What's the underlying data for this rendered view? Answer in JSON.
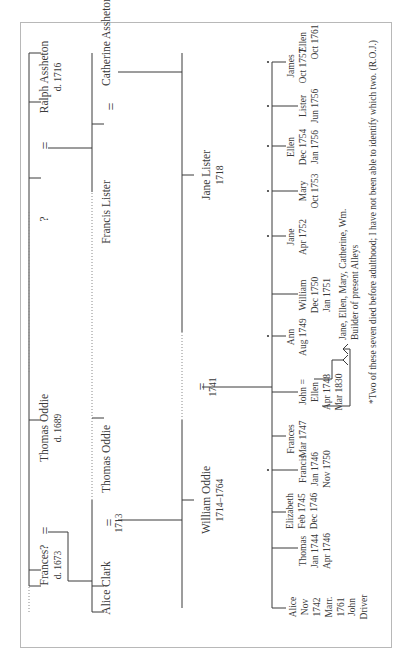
{
  "generation_1": {
    "left_couple": {
      "husband_unknown": "?",
      "wife": {
        "name": "Ralph Assheton",
        "dates": "d. 1716"
      }
    },
    "right_couple": {
      "wife": {
        "name": "Frances?",
        "dates": "d. 1673"
      },
      "husband": {
        "name": "Thomas Oddie",
        "dates": "d. 1689"
      }
    }
  },
  "generation_2": {
    "lister_side": {
      "husband": {
        "name": "Francis Lister"
      },
      "wife": {
        "name": "Catherine Assheton"
      }
    },
    "oddie_side": {
      "husband": {
        "name": "Thomas Oddie"
      },
      "wife": {
        "name": "Alice Clark"
      },
      "marriage_year": "1713"
    }
  },
  "generation_3": {
    "husband": {
      "name": "William Oddie",
      "dates": "1714–1764"
    },
    "wife": {
      "name": "Jane Lister",
      "dates": "1718"
    },
    "marriage_year": "1741"
  },
  "marriage_symbol": "=",
  "children": [
    {
      "name": "Alice",
      "lines": [
        "Nov",
        "1742",
        "Marr.",
        "1761",
        "John",
        "Driver"
      ],
      "asterisk": false
    },
    {
      "name": "Thomas",
      "lines": [
        "Jan 1744",
        "Apr 1746"
      ],
      "asterisk": false
    },
    {
      "name": "Elizabeth",
      "lines": [
        "Feb 1745",
        "Dec 1746"
      ],
      "asterisk": false
    },
    {
      "name": "Francis",
      "lines": [
        "Jan 1746",
        "Nov 1750"
      ],
      "asterisk": false
    },
    {
      "name": "Frances",
      "lines": [
        "Mar 1747"
      ],
      "asterisk": true
    },
    {
      "name": "John =",
      "lines": [
        "Ellen",
        "Apr 1748",
        "Mar 1830"
      ],
      "asterisk": false
    },
    {
      "name": "Ann",
      "lines": [
        "Aug 1749"
      ],
      "asterisk": true
    },
    {
      "name": "William",
      "lines": [
        "Dec 1750",
        "Jan 1751"
      ],
      "asterisk": false
    },
    {
      "name": "Jane",
      "lines": [
        "Apr 1752"
      ],
      "asterisk": true
    },
    {
      "name": "Mary",
      "lines": [
        "Oct 1753"
      ],
      "asterisk": true
    },
    {
      "name": "Ellen",
      "lines": [
        "Dec 1754",
        "Jan 1756"
      ],
      "asterisk": false
    },
    {
      "name": "Lister",
      "lines": [
        "Jun 1756"
      ],
      "asterisk": true
    },
    {
      "name": "James",
      "lines": [
        "Oct 1757"
      ],
      "asterisk": true
    },
    {
      "name": "Ellen",
      "lines": [
        "Oct 1761"
      ],
      "asterisk": true
    }
  ],
  "john_descendants": {
    "children_line": "Jane, Ellen, Mary, Catherine, Wm.",
    "builder_line": "Builder of present Alleys"
  },
  "footnote": "*Two of these seven died before adulthood; I have not been able to identify which two. (R.O.J.)",
  "colors": {
    "ink": "#3a3a3a",
    "frame": "#b8b8b8",
    "background": "#ffffff"
  }
}
